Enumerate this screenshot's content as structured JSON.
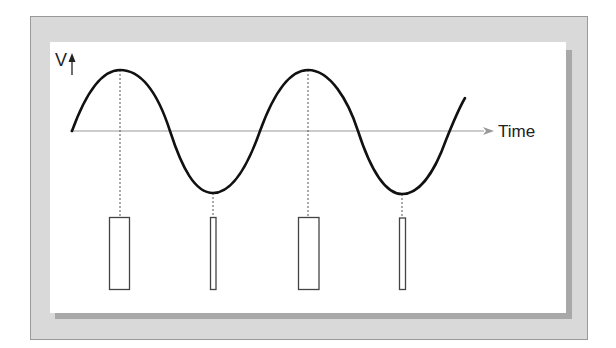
{
  "diagram": {
    "y_axis_label": "V",
    "x_axis_label": "Time",
    "colors": {
      "frame": "#d9d9d9",
      "frame_border": "#9a9a9a",
      "shadow": "#a8a8a8",
      "panel": "#ffffff",
      "curve": "#111111",
      "axis": "#999999",
      "guide": "#555555",
      "pulse_stroke": "#444444"
    },
    "waveform": {
      "type": "sine",
      "cycles_shown": 2.2,
      "peaks": [
        {
          "x": 120,
          "y": 70
        },
        {
          "x": 308,
          "y": 70
        }
      ],
      "troughs": [
        {
          "x": 213,
          "y": 193
        },
        {
          "x": 402,
          "y": 194
        }
      ],
      "baseline_y": 131
    },
    "pulses": [
      {
        "label": "pulse-1",
        "aligned_to": "peak",
        "width": "wide"
      },
      {
        "label": "pulse-2",
        "aligned_to": "trough",
        "width": "narrow"
      },
      {
        "label": "pulse-3",
        "aligned_to": "peak",
        "width": "wide"
      },
      {
        "label": "pulse-4",
        "aligned_to": "trough",
        "width": "narrow"
      }
    ]
  }
}
